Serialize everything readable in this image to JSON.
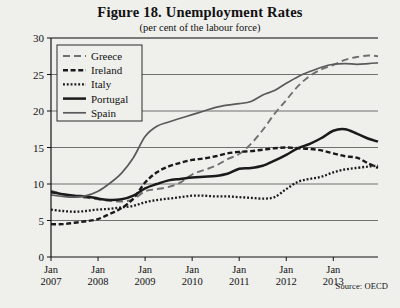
{
  "figure": {
    "title": "Figure 18. Unemployment Rates",
    "subtitle": "(per cent of the labour force)",
    "source": "Source: OECD"
  },
  "chart_data": {
    "type": "line",
    "title": "Figure 18. Unemployment Rates",
    "subtitle": "(per cent of the labour force)",
    "xlabel": "",
    "ylabel": "",
    "ylim": [
      0,
      30
    ],
    "yticks": [
      0,
      5,
      10,
      15,
      20,
      25,
      30
    ],
    "xlim": [
      2007.0,
      2013.95
    ],
    "xticks": [
      2007,
      2008,
      2009,
      2010,
      2011,
      2012,
      2013
    ],
    "xticklabels": [
      "Jan\n2007",
      "Jan\n2008",
      "Jan\n2009",
      "Jan\n2010",
      "Jan\n2011",
      "Jan\n2012",
      "Jan\n2013"
    ],
    "grid": "horizontal",
    "legend_position": "upper left",
    "source": "Source: OECD",
    "x": [
      2007.0,
      2007.25,
      2007.5,
      2007.75,
      2008.0,
      2008.25,
      2008.5,
      2008.75,
      2009.0,
      2009.25,
      2009.5,
      2009.75,
      2010.0,
      2010.25,
      2010.5,
      2010.75,
      2011.0,
      2011.25,
      2011.5,
      2011.75,
      2012.0,
      2012.25,
      2012.5,
      2012.75,
      2013.0,
      2013.25,
      2013.5,
      2013.75,
      2013.95
    ],
    "series": [
      {
        "name": "Greece",
        "style": "long-dash",
        "color": "#6f6f6f",
        "values": [
          9.1,
          8.6,
          8.3,
          8.1,
          7.9,
          7.7,
          7.6,
          7.9,
          9.0,
          9.3,
          9.6,
          10.2,
          11.3,
          11.9,
          12.5,
          13.4,
          14.1,
          15.5,
          17.4,
          19.6,
          21.5,
          23.4,
          24.8,
          25.7,
          26.3,
          27.0,
          27.4,
          27.6,
          27.5
        ]
      },
      {
        "name": "Ireland",
        "style": "dash",
        "color": "#1a1a1a",
        "values": [
          4.5,
          4.5,
          4.7,
          4.9,
          5.2,
          5.9,
          6.7,
          8.0,
          10.2,
          11.6,
          12.4,
          12.9,
          13.3,
          13.5,
          13.8,
          14.2,
          14.4,
          14.5,
          14.7,
          14.9,
          15.0,
          14.9,
          14.8,
          14.6,
          14.2,
          13.8,
          13.6,
          12.8,
          12.2
        ]
      },
      {
        "name": "Italy",
        "style": "dot",
        "color": "#1a1a1a",
        "values": [
          6.5,
          6.3,
          6.2,
          6.3,
          6.5,
          6.6,
          6.8,
          7.0,
          7.5,
          7.8,
          8.0,
          8.2,
          8.4,
          8.4,
          8.3,
          8.3,
          8.2,
          8.1,
          8.0,
          8.2,
          9.3,
          10.3,
          10.7,
          11.0,
          11.6,
          12.0,
          12.2,
          12.4,
          12.5
        ]
      },
      {
        "name": "Portugal",
        "style": "solid-thick",
        "color": "#1a1a1a",
        "values": [
          8.9,
          8.6,
          8.4,
          8.3,
          8.0,
          7.8,
          7.9,
          8.4,
          9.4,
          10.0,
          10.5,
          10.7,
          10.9,
          11.0,
          11.1,
          11.4,
          12.1,
          12.2,
          12.5,
          13.2,
          14.0,
          14.9,
          15.5,
          16.3,
          17.3,
          17.5,
          16.9,
          16.2,
          15.8
        ]
      },
      {
        "name": "Spain",
        "style": "solid",
        "color": "#5a5a5a",
        "values": [
          8.5,
          8.3,
          8.2,
          8.4,
          9.0,
          10.1,
          11.5,
          13.6,
          16.5,
          17.9,
          18.5,
          19.0,
          19.5,
          20.0,
          20.5,
          20.8,
          21.0,
          21.3,
          22.2,
          22.8,
          23.8,
          24.7,
          25.4,
          26.0,
          26.4,
          26.5,
          26.4,
          26.5,
          26.6
        ]
      }
    ]
  }
}
